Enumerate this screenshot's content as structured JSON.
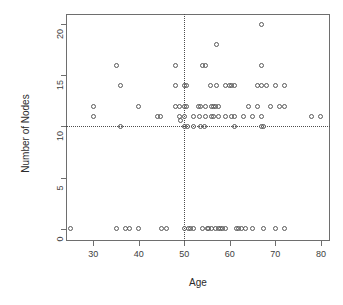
{
  "chart_data": {
    "type": "scatter",
    "title": "",
    "xlabel": "Age",
    "ylabel": "Number of Nodes",
    "xlim": [
      24,
      82
    ],
    "ylim": [
      -1.2,
      21
    ],
    "xticks": [
      30,
      40,
      50,
      60,
      70,
      80
    ],
    "yticks": [
      0,
      5,
      10,
      15,
      20
    ],
    "grid": false,
    "legend": null,
    "marker": "open-circle",
    "marker_color": "#595959",
    "reference_lines": [
      {
        "orientation": "horizontal",
        "value": 10,
        "style": "dotted",
        "color": "#4d4d4d"
      },
      {
        "orientation": "vertical",
        "value": 50,
        "style": "dotted",
        "color": "#4d4d4d"
      }
    ],
    "points": [
      [
        25,
        0
      ],
      [
        30,
        12
      ],
      [
        30,
        11
      ],
      [
        35,
        16
      ],
      [
        35,
        0
      ],
      [
        36,
        14
      ],
      [
        36,
        10
      ],
      [
        37,
        0
      ],
      [
        38,
        0
      ],
      [
        40,
        12
      ],
      [
        40,
        0
      ],
      [
        44,
        11
      ],
      [
        44.8,
        11
      ],
      [
        45,
        0
      ],
      [
        46,
        0
      ],
      [
        48,
        16
      ],
      [
        48,
        12
      ],
      [
        48,
        14
      ],
      [
        49,
        12
      ],
      [
        49,
        11
      ],
      [
        49.2,
        10.6
      ],
      [
        50,
        14
      ],
      [
        50,
        12
      ],
      [
        50,
        11
      ],
      [
        50,
        10
      ],
      [
        50,
        0
      ],
      [
        50.4,
        14
      ],
      [
        50.4,
        12
      ],
      [
        50.6,
        10
      ],
      [
        51,
        0
      ],
      [
        51.4,
        0
      ],
      [
        52,
        11
      ],
      [
        52,
        10
      ],
      [
        52,
        0
      ],
      [
        53,
        12
      ],
      [
        53.6,
        12
      ],
      [
        53.4,
        11
      ],
      [
        53.6,
        10
      ],
      [
        54,
        16
      ],
      [
        54,
        0
      ],
      [
        54.6,
        16
      ],
      [
        54.6,
        12
      ],
      [
        54.6,
        11
      ],
      [
        54.4,
        10
      ],
      [
        55,
        0
      ],
      [
        55.4,
        0
      ],
      [
        55.8,
        14
      ],
      [
        56,
        12
      ],
      [
        56,
        11
      ],
      [
        56,
        0
      ],
      [
        56.4,
        12
      ],
      [
        56.4,
        11
      ],
      [
        56.8,
        12
      ],
      [
        56.8,
        0
      ],
      [
        57,
        18
      ],
      [
        57,
        14
      ],
      [
        57.4,
        12
      ],
      [
        57.4,
        11
      ],
      [
        57.6,
        0
      ],
      [
        58,
        0
      ],
      [
        58.4,
        0
      ],
      [
        59,
        14
      ],
      [
        59,
        11
      ],
      [
        59,
        0
      ],
      [
        60,
        14
      ],
      [
        60.4,
        14
      ],
      [
        60.4,
        11
      ],
      [
        61,
        14
      ],
      [
        61,
        11
      ],
      [
        61,
        10
      ],
      [
        61.4,
        0
      ],
      [
        62,
        0
      ],
      [
        62.6,
        0
      ],
      [
        63,
        11
      ],
      [
        63.4,
        0
      ],
      [
        64,
        12
      ],
      [
        65,
        11
      ],
      [
        65,
        0
      ],
      [
        66,
        14
      ],
      [
        66,
        12
      ],
      [
        67,
        20
      ],
      [
        67,
        16
      ],
      [
        67,
        14
      ],
      [
        67,
        11
      ],
      [
        67,
        10
      ],
      [
        67.4,
        10
      ],
      [
        67.4,
        0
      ],
      [
        68,
        14
      ],
      [
        69,
        12
      ],
      [
        70,
        14
      ],
      [
        70,
        0
      ],
      [
        71,
        12
      ],
      [
        72,
        14
      ],
      [
        72,
        12
      ],
      [
        72,
        0
      ],
      [
        78,
        11
      ],
      [
        80,
        11
      ]
    ]
  },
  "axis": {
    "x_title": "Age",
    "y_title": "Number of Nodes",
    "x_tick_labels": [
      "30",
      "40",
      "50",
      "60",
      "70",
      "80"
    ],
    "y_tick_labels": [
      "0",
      "5",
      "10",
      "15",
      "20"
    ]
  }
}
